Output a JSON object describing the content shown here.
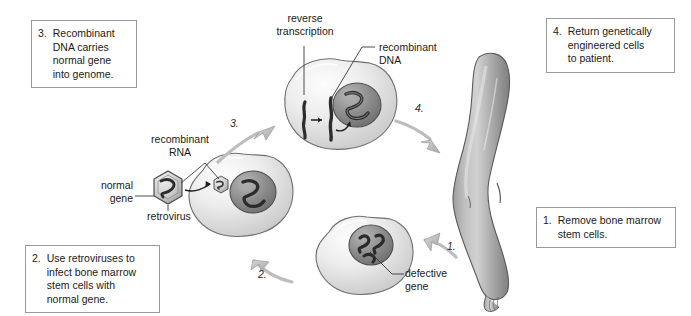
{
  "diagram": {
    "background_color": "#ffffff",
    "box_border_color": "#9a9a9a",
    "text_color": "#1a1a1a",
    "arrow_color": "#b4b4b4",
    "cell_fill": "#e3e3e3",
    "nucleus_fill": "#8f8f8f",
    "limb_fill": "#a5a5a5"
  },
  "steps": [
    {
      "id": "step-3",
      "number": "3.",
      "text": "Recombinant\nDNA carries\nnormal gene\ninto genome."
    },
    {
      "id": "step-4",
      "number": "4.",
      "text": "Return genetically\nengineered cells\nto patient."
    },
    {
      "id": "step-1",
      "number": "1.",
      "text": "Remove bone marrow\nstem cells."
    },
    {
      "id": "step-2",
      "number": "2.",
      "text": "Use retroviruses to\ninfect bone marrow\nstem cells with\nnormal gene."
    }
  ],
  "labels": {
    "reverse_transcription": "reverse\ntranscription",
    "recombinant_dna": "recombinant\nDNA",
    "recombinant_rna": "recombinant\nRNA",
    "normal_gene": "normal\ngene",
    "retrovirus": "retrovirus",
    "defective_gene": "defective\ngene"
  },
  "arrow_numbers": {
    "one": "1.",
    "two": "2.",
    "three": "3.",
    "four": "4."
  }
}
